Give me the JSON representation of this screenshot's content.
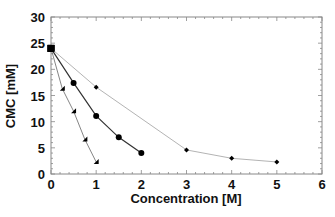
{
  "chart_data": {
    "type": "line",
    "title": "",
    "xlabel": "Concentration [M]",
    "ylabel": "CMC [mM]",
    "xlim": [
      0,
      6
    ],
    "ylim": [
      0,
      30
    ],
    "x_ticks": [
      0,
      1,
      2,
      3,
      4,
      5,
      6
    ],
    "y_ticks": [
      0,
      5,
      10,
      15,
      20,
      25,
      30
    ],
    "x_minor_step": 0.2,
    "y_minor_step": 1,
    "grid": false,
    "legend": "none",
    "series": [
      {
        "name": "series-triangle",
        "marker": "triangle",
        "line_color": "#777777",
        "x": [
          0,
          0.25,
          0.5,
          0.75,
          1.0
        ],
        "y": [
          24,
          16.3,
          12.0,
          6.6,
          2.3
        ]
      },
      {
        "name": "series-circle",
        "marker": "circle",
        "line_color": "#333333",
        "x": [
          0,
          0.5,
          1.0,
          1.5,
          2.0
        ],
        "y": [
          24,
          17.4,
          11.1,
          7.0,
          4.0
        ]
      },
      {
        "name": "series-diamond",
        "marker": "diamond",
        "line_color": "#aaaaaa",
        "x": [
          0,
          1,
          3,
          4,
          5
        ],
        "y": [
          24,
          16.6,
          4.6,
          3.0,
          2.3
        ]
      }
    ]
  }
}
